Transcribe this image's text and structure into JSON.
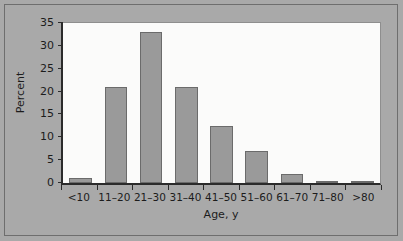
{
  "chart_data": {
    "type": "bar",
    "title": "",
    "xlabel": "Age, y",
    "ylabel": "Percent",
    "categories": [
      "<10",
      "11–20",
      "21–30",
      "31–40",
      "41–50",
      "51–60",
      "61–70",
      "71–80",
      ">80"
    ],
    "values": [
      1,
      21,
      33,
      21,
      12.5,
      7,
      2,
      0.5,
      0.3
    ],
    "ylim": [
      0,
      35
    ],
    "ytick_labels": [
      "0",
      "5",
      "10",
      "15",
      "20",
      "25",
      "30",
      "35"
    ],
    "ytick_values": [
      0,
      5,
      10,
      15,
      20,
      25,
      30,
      35
    ],
    "grid": false,
    "legend": false,
    "colors": {
      "bar_fill": "#9a9a9a",
      "bar_edge": "#6b6b6b",
      "plot_background": "#fbfbfa",
      "page_background": "#a9a9a9",
      "axis": "#2b2b2b",
      "text": "#1c1c1c"
    }
  }
}
